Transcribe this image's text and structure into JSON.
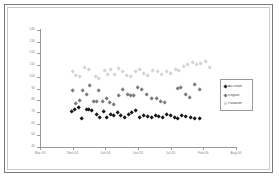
{
  "chart_data": {
    "type": "scatter",
    "title": "",
    "xlabel": "",
    "ylabel": "",
    "ylim": [
      40,
      140
    ],
    "y_ticks": [
      140,
      130,
      120,
      110,
      100,
      90,
      80,
      70,
      60,
      50,
      40
    ],
    "x_ticks": [
      "Mar-03",
      "Nov-03",
      "Jun-04",
      "Jan-05",
      "Jul-05",
      "Feb-06",
      "Aug-06"
    ],
    "grid": false,
    "legend_position": "right",
    "series": [
      {
        "name": "Ak-cream",
        "color": "#d4d4d4",
        "marker": "diamond",
        "points": [
          [
            0.165,
            104
          ],
          [
            0.18,
            101
          ],
          [
            0.205,
            100
          ],
          [
            0.23,
            108
          ],
          [
            0.25,
            106
          ],
          [
            0.285,
            100
          ],
          [
            0.3,
            98
          ],
          [
            0.33,
            105
          ],
          [
            0.345,
            102
          ],
          [
            0.36,
            106
          ],
          [
            0.38,
            102
          ],
          [
            0.4,
            107
          ],
          [
            0.42,
            104
          ],
          [
            0.44,
            101
          ],
          [
            0.465,
            100
          ],
          [
            0.49,
            104
          ],
          [
            0.51,
            106
          ],
          [
            0.53,
            103
          ],
          [
            0.55,
            101
          ],
          [
            0.575,
            105
          ],
          [
            0.6,
            104
          ],
          [
            0.62,
            102
          ],
          [
            0.645,
            104
          ],
          [
            0.665,
            103
          ],
          [
            0.69,
            106
          ],
          [
            0.71,
            105
          ],
          [
            0.735,
            109
          ],
          [
            0.755,
            110
          ],
          [
            0.78,
            112
          ],
          [
            0.8,
            110
          ],
          [
            0.82,
            111
          ],
          [
            0.845,
            113
          ],
          [
            0.865,
            108
          ]
        ]
      },
      {
        "name": "Regular",
        "color": "#7d7d7d",
        "marker": "diamond",
        "points": [
          [
            0.165,
            88
          ],
          [
            0.18,
            77
          ],
          [
            0.2,
            80
          ],
          [
            0.22,
            88
          ],
          [
            0.24,
            85
          ],
          [
            0.255,
            92
          ],
          [
            0.275,
            79
          ],
          [
            0.29,
            79
          ],
          [
            0.3,
            88
          ],
          [
            0.32,
            79
          ],
          [
            0.34,
            81
          ],
          [
            0.355,
            78
          ],
          [
            0.375,
            76
          ],
          [
            0.4,
            84
          ],
          [
            0.42,
            89
          ],
          [
            0.445,
            85
          ],
          [
            0.465,
            84
          ],
          [
            0.48,
            84
          ],
          [
            0.5,
            91
          ],
          [
            0.52,
            89
          ],
          [
            0.545,
            85
          ],
          [
            0.57,
            81
          ],
          [
            0.595,
            81
          ],
          [
            0.615,
            79
          ],
          [
            0.635,
            78
          ],
          [
            0.7,
            90
          ],
          [
            0.72,
            91
          ],
          [
            0.745,
            85
          ],
          [
            0.765,
            82
          ],
          [
            0.79,
            93
          ],
          [
            0.815,
            89
          ]
        ]
      },
      {
        "name": "Paladium",
        "color": "#1a1a1a",
        "marker": "diamond",
        "points": [
          [
            0.16,
            70
          ],
          [
            0.175,
            72
          ],
          [
            0.195,
            74
          ],
          [
            0.215,
            64
          ],
          [
            0.24,
            72
          ],
          [
            0.25,
            72
          ],
          [
            0.265,
            71
          ],
          [
            0.29,
            68
          ],
          [
            0.305,
            65
          ],
          [
            0.325,
            70
          ],
          [
            0.34,
            65
          ],
          [
            0.36,
            68
          ],
          [
            0.375,
            67
          ],
          [
            0.395,
            69
          ],
          [
            0.41,
            67
          ],
          [
            0.43,
            65
          ],
          [
            0.45,
            68
          ],
          [
            0.47,
            69
          ],
          [
            0.49,
            71
          ],
          [
            0.51,
            65
          ],
          [
            0.53,
            67
          ],
          [
            0.55,
            66
          ],
          [
            0.57,
            65
          ],
          [
            0.59,
            67
          ],
          [
            0.605,
            66
          ],
          [
            0.625,
            65
          ],
          [
            0.645,
            68
          ],
          [
            0.665,
            67
          ],
          [
            0.685,
            65
          ],
          [
            0.705,
            64
          ],
          [
            0.725,
            67
          ],
          [
            0.745,
            66
          ],
          [
            0.77,
            65
          ],
          [
            0.79,
            64
          ],
          [
            0.815,
            64
          ]
        ]
      }
    ]
  },
  "legend": {
    "entries": [
      {
        "label": "Ak-cream",
        "color": "#1a1a1a"
      },
      {
        "label": "Regular",
        "color": "#7d7d7d"
      },
      {
        "label": "Paladium",
        "color": "#d4d4d4"
      }
    ]
  }
}
